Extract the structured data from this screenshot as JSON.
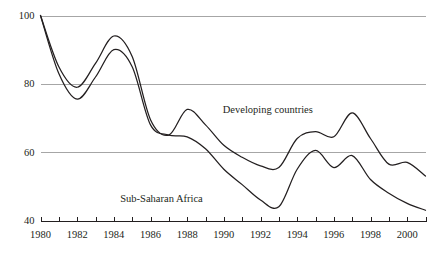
{
  "chart_data": {
    "type": "line",
    "title": "",
    "subtitle": "",
    "xlabel": "",
    "ylabel": "",
    "xlim": [
      1980,
      2001
    ],
    "ylim": [
      40,
      100
    ],
    "grid": true,
    "gridlines_y": [
      100,
      80,
      60
    ],
    "axis_baseline_y": 40,
    "y_ticks": [
      100,
      80,
      60,
      40
    ],
    "y_tick_labels": [
      "100",
      "80",
      "60",
      "40"
    ],
    "x_ticks": [
      1980,
      1981,
      1982,
      1983,
      1984,
      1985,
      1986,
      1987,
      1988,
      1989,
      1990,
      1991,
      1992,
      1993,
      1994,
      1995,
      1996,
      1997,
      1998,
      1999,
      2000,
      2001
    ],
    "x_tick_labels_shown": [
      "1980",
      "1982",
      "1984",
      "1986",
      "1988",
      "1990",
      "1992",
      "1994",
      "1996",
      "1998",
      "2000"
    ],
    "x_tick_label_years": [
      1980,
      1982,
      1984,
      1986,
      1988,
      1990,
      1992,
      1994,
      1996,
      1998,
      2000
    ],
    "legend_position": "inline-annotation",
    "line_color": "#231f20",
    "grid_color": "#a6a6a6",
    "axis_color": "#231f20",
    "background": "#ffffff",
    "x": [
      1980,
      1981,
      1982,
      1983,
      1984,
      1985,
      1986,
      1987,
      1988,
      1989,
      1990,
      1991,
      1992,
      1993,
      1994,
      1995,
      1996,
      1997,
      1998,
      1999,
      2000,
      2001
    ],
    "series": [
      {
        "name": "Developing countries",
        "label_x": 1992.4,
        "label_y": 71.5,
        "values": [
          100,
          85,
          79,
          86,
          94,
          88,
          69.5,
          65,
          72.5,
          68,
          62,
          58.5,
          56,
          55.5,
          64,
          66,
          64.5,
          71.5,
          64,
          56.5,
          57,
          53
        ]
      },
      {
        "name": "Sub-Saharan Africa",
        "label_x": 1986.6,
        "label_y": 45.5,
        "values": [
          100,
          83,
          75.5,
          82,
          90,
          85,
          68,
          65,
          64.5,
          61,
          55,
          50.5,
          46,
          44,
          55,
          60.5,
          55.5,
          59,
          52,
          48,
          45,
          43
        ]
      }
    ],
    "annotations": [
      {
        "text": "Developing countries",
        "x": 1992.4,
        "y": 71.5
      },
      {
        "text": "Sub-Saharan Africa",
        "x": 1986.6,
        "y": 45.5
      }
    ]
  }
}
